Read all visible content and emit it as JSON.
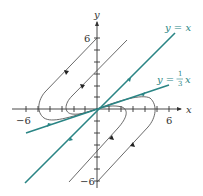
{
  "diagram": {
    "type": "phase-portrait",
    "colors": {
      "axis": "#333333",
      "trajectory": "#444444",
      "eigenline": "#2a8585",
      "background": "#ffffff"
    },
    "axes": {
      "x_label": "x",
      "y_label": "y",
      "x_ticks": [
        -6,
        -5,
        -4,
        -3,
        -2,
        -1,
        1,
        2,
        3,
        4,
        5,
        6
      ],
      "y_ticks": [
        -6,
        -5,
        -4,
        -3,
        -2,
        -1,
        1,
        2,
        3,
        4,
        5,
        6
      ],
      "x_tick_labels": {
        "neg": "−6",
        "pos": "6"
      },
      "y_tick_labels": {
        "pos": "6",
        "neg": "−6"
      },
      "range": [
        -6,
        6
      ]
    },
    "eigenlines": [
      {
        "label": "y = x",
        "equation": "y = x",
        "direction": "toward origin"
      },
      {
        "label_prefix": "y =",
        "frac_num": "1",
        "frac_den": "3",
        "label_suffix": "x",
        "equation": "y = (1/3)x",
        "direction": "toward origin"
      }
    ],
    "trajectories_count": 4
  }
}
